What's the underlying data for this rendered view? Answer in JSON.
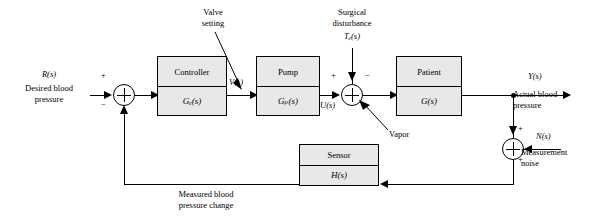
{
  "diagram": {
    "blocks": [
      {
        "name": "controller",
        "label": "Controller",
        "transfer": "Gₑ(s)"
      },
      {
        "name": "pump",
        "label": "Pump",
        "transfer": "Gₚ(s)"
      },
      {
        "name": "patient",
        "label": "Patient",
        "transfer": "G(s)"
      },
      {
        "name": "sensor",
        "label": "Sensor",
        "transfer": "H(s)"
      }
    ],
    "labels": {
      "input_signal": "R(s)",
      "input_text_line1": "Desired blood",
      "input_text_line2": "pressure",
      "valve_setting_line1": "Valve",
      "valve_setting_line2": "setting",
      "valve_signal": "V(s)",
      "surgical_line1": "Surgical",
      "surgical_line2": "disturbance",
      "surgical_signal": "Tₑ(s)",
      "pump_output_signal": "U(s)",
      "vapor": "Vapor",
      "output_signal": "Y(s)",
      "output_text_line1": "Actual blood",
      "output_text_line2": "pressure",
      "noise_signal": "N(s)",
      "noise_text_line1": "Measurement",
      "noise_text_line2": "noise",
      "feedback_line1": "Measured blood",
      "feedback_line2": "pressure change",
      "sum1_plus": "+",
      "sum1_minus": "−",
      "sum2_plus": "+",
      "sum2_minus": "−",
      "sum3_plus_top": "+",
      "sum3_plus_bottom": "+"
    },
    "colors": {
      "block_fill": "#e8e8e8",
      "stroke": "#000000",
      "background": "#ffffff"
    }
  }
}
